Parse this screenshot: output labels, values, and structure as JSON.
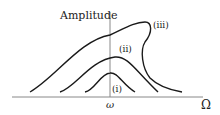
{
  "diagram": {
    "type": "resonance-curves",
    "y_axis_label": "Amplitude",
    "x_axis_label": "Ω",
    "x_tick_label": "ω",
    "curves": [
      {
        "id": "i",
        "label": "(i)"
      },
      {
        "id": "ii",
        "label": "(ii)"
      },
      {
        "id": "iii",
        "label": "(iii)"
      }
    ],
    "colors": {
      "curve": "#1a1a1a",
      "axis": "#888888",
      "text": "#222222"
    }
  }
}
